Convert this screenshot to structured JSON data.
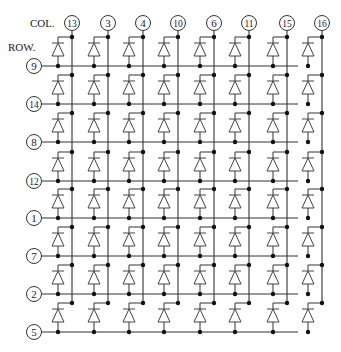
{
  "diagram": {
    "type": "led-dot-matrix-schematic",
    "col_header": "COL.",
    "row_header": "ROW.",
    "columns": [
      {
        "pin": "13",
        "x": 72
      },
      {
        "pin": "3",
        "x": 108
      },
      {
        "pin": "4",
        "x": 143
      },
      {
        "pin": "10",
        "x": 178
      },
      {
        "pin": "6",
        "x": 214
      },
      {
        "pin": "11",
        "x": 249
      },
      {
        "pin": "15",
        "x": 287
      },
      {
        "pin": "16",
        "x": 322
      }
    ],
    "rows": [
      {
        "pin": "9",
        "y": 66
      },
      {
        "pin": "14",
        "y": 104
      },
      {
        "pin": "8",
        "y": 142
      },
      {
        "pin": "12",
        "y": 181
      },
      {
        "pin": "1",
        "y": 218
      },
      {
        "pin": "7",
        "y": 256
      },
      {
        "pin": "2",
        "y": 294
      },
      {
        "pin": "5",
        "y": 332
      }
    ],
    "col_pin_y": 23,
    "row_pin_x": 34,
    "line_color": "#333333",
    "diode_color": "#444444"
  }
}
